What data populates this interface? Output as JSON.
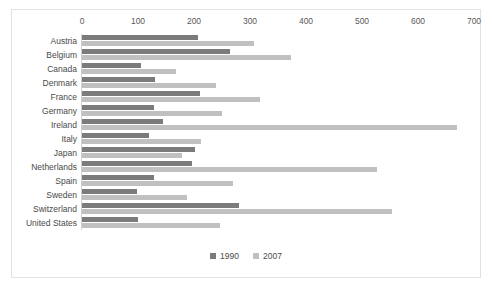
{
  "chart_data": {
    "type": "bar",
    "orientation": "horizontal",
    "title": "",
    "xlabel": "",
    "ylabel": "",
    "xlim": [
      0,
      700
    ],
    "xticks": [
      0,
      100,
      200,
      300,
      400,
      500,
      600,
      700
    ],
    "grid": false,
    "legend_position": "bottom-center",
    "categories": [
      "Austria",
      "Belgium",
      "Canada",
      "Denmark",
      "France",
      "Germany",
      "Ireland",
      "Italy",
      "Japan",
      "Netherlands",
      "Spain",
      "Sweden",
      "Switzerland",
      "United States"
    ],
    "series": [
      {
        "name": "1990",
        "color": "#7b7b7b",
        "values": [
          207,
          264,
          105,
          130,
          210,
          128,
          145,
          120,
          202,
          196,
          128,
          98,
          280,
          100
        ]
      },
      {
        "name": "2007",
        "color": "#c0c0c0",
        "values": [
          307,
          373,
          168,
          240,
          318,
          250,
          670,
          212,
          178,
          527,
          270,
          188,
          554,
          247
        ]
      }
    ]
  },
  "colors": {
    "series_1990": "#7b7b7b",
    "series_2007": "#c0c0c0",
    "frame_border": "#e2e2e2",
    "axis_line": "#d0d0d0",
    "text": "#4a4a4a",
    "background": "#ffffff"
  }
}
